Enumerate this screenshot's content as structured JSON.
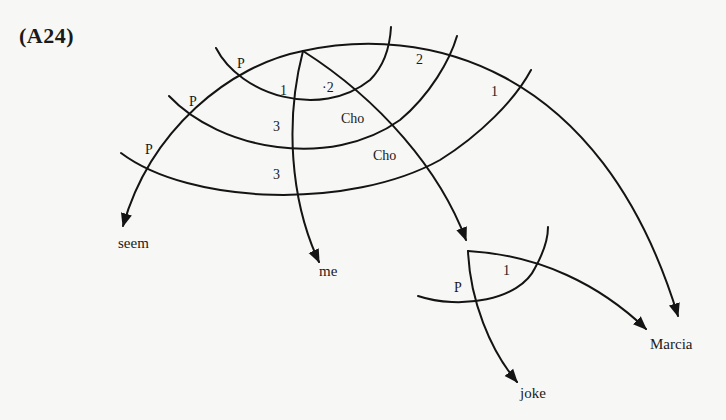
{
  "figure": {
    "label": "(A24)"
  },
  "nodes": {
    "seem": "seem",
    "me": "me",
    "joke": "joke",
    "marcia": "Marcia"
  },
  "arc_labels": {
    "p_top": "P",
    "p_mid": "P",
    "p_low": "P",
    "one_left": "1",
    "two_inner": "·2",
    "two_outer": "2",
    "one_right": "1",
    "three_upper": "3",
    "three_lower": "3",
    "cho_upper": "Cho",
    "cho_lower": "Cho",
    "p_sub": "P",
    "one_sub": "1"
  },
  "colors": {
    "ink": "#141414",
    "paper": "#f7f7f5"
  }
}
